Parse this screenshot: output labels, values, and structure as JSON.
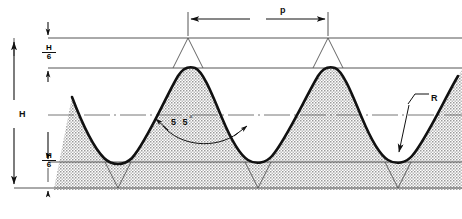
{
  "diagram": {
    "labels": {
      "pitch": "p",
      "height": "H",
      "radius": "R",
      "angle_value": "5 5",
      "angle_degree_symbol": "°",
      "truncation_numerator": "H",
      "truncation_denominator": "6"
    },
    "geometry": {
      "thread_angle_deg": 55,
      "crest_truncation": "H/6",
      "root_truncation": "H/6",
      "pitch_px": 140,
      "sharp_crest_y": 38,
      "crest_flat_y": 68,
      "pitch_line_y": 115,
      "root_flat_y": 162,
      "sharp_root_y": 188,
      "left_start_x": 72,
      "right_end_x": 452
    },
    "colors": {
      "outline": "#111111",
      "thin_line": "#555555",
      "stipple": "#9a9a9a",
      "background": "#ffffff"
    }
  }
}
